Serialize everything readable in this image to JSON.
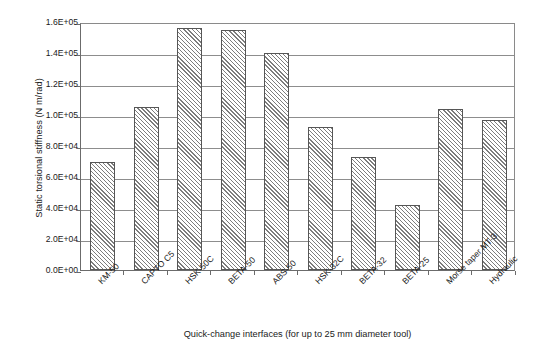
{
  "chart_data": {
    "type": "bar",
    "title": "",
    "xlabel": "Quick-change interfaces (for up to 25 mm diameter tool)",
    "ylabel": "Static torsional stiffness (N m/rad)",
    "categories": [
      "KM-50",
      "CAPTO C5",
      "HSK-50C",
      "BETA-50",
      "ABS-50",
      "HSK-32C",
      "BETA-32",
      "BETA-25",
      "Morse taper MT-3",
      "Hydraulic"
    ],
    "values": [
      70000,
      105000,
      156000,
      155000,
      140000,
      92000,
      73000,
      42000,
      104000,
      97000
    ],
    "ylim": [
      0,
      160000
    ],
    "ytick_values": [
      0,
      20000,
      40000,
      60000,
      80000,
      100000,
      120000,
      140000,
      160000
    ],
    "ytick_labels": [
      "0.0E+00",
      "2.0E+04",
      "4.0E+04",
      "6.0E+04",
      "8.0E+04",
      "1.0E+05",
      "1.2E+05",
      "1.4E+05",
      "1.6E+05"
    ],
    "grid": true,
    "legend": "none",
    "bar_fill": "diagonal-hatch",
    "bar_border_color": "#565656",
    "gridline_color": "#8d8d8d",
    "axis_color": "#6b6b6b",
    "background_color": "#ffffff"
  }
}
